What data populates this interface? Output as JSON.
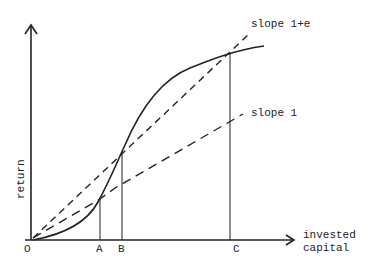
{
  "diagram": {
    "labels": {
      "origin": "O",
      "point_a": "A",
      "point_b": "B",
      "point_c": "C",
      "x_axis_line1": "invested",
      "x_axis_line2": "capital",
      "y_axis": "return",
      "slope_upper": "slope 1+e",
      "slope_lower": "slope 1"
    },
    "colors": {
      "ink": "#222222",
      "background": "#ffffff"
    }
  }
}
